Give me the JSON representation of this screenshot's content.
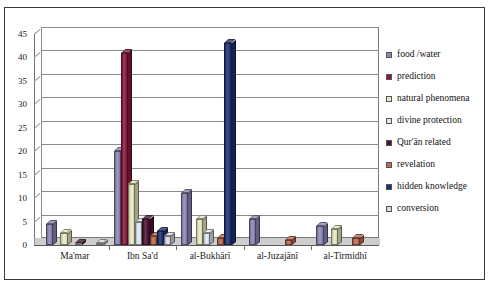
{
  "chart_data": {
    "type": "bar",
    "title": "",
    "subtitle": "",
    "xlabel": "",
    "ylabel": "",
    "ylim": [
      0,
      45
    ],
    "ytick_step": 5,
    "yticks": [
      0,
      5,
      10,
      15,
      20,
      25,
      30,
      35,
      40,
      45
    ],
    "grid": true,
    "grid_orientation": "horizontal",
    "legend_position": "right",
    "three_d": true,
    "categories": [
      "Ma'mar",
      "Ibn Sa'd",
      "al-Bukhārī",
      "al-Juzajānī",
      "al-Tirmidhī"
    ],
    "series": [
      {
        "name": "food /water",
        "color": "#8d86b5",
        "values": [
          4.5,
          20,
          11,
          5.5,
          4
        ]
      },
      {
        "name": "prediction",
        "color": "#8c1a3c",
        "values": [
          0,
          41,
          0,
          0,
          0
        ]
      },
      {
        "name": "natural phenomena",
        "color": "#e8e8c0",
        "values": [
          2.5,
          13,
          5.5,
          0,
          3.5
        ]
      },
      {
        "name": "divine protection",
        "color": "#dfe7f0",
        "values": [
          0,
          5,
          2.5,
          0,
          0
        ]
      },
      {
        "name": "Qur'ān related",
        "color": "#4c1133",
        "values": [
          0.4,
          5.5,
          0,
          0,
          0
        ]
      },
      {
        "name": "revelation",
        "color": "#c0694e",
        "values": [
          0,
          2,
          1.5,
          1,
          1.5
        ]
      },
      {
        "name": "hidden knowledge",
        "color": "#1f3173",
        "values": [
          0,
          3,
          43,
          0,
          0
        ]
      },
      {
        "name": "conversion",
        "color": "#d9d9e4",
        "values": [
          0.5,
          2,
          0,
          0,
          0
        ]
      }
    ]
  },
  "legend": {
    "items": [
      {
        "label": "food /water"
      },
      {
        "label": "prediction"
      },
      {
        "label": "natural phenomena"
      },
      {
        "label": "divine protection"
      },
      {
        "label": "Qur'ān related"
      },
      {
        "label": "revelation"
      },
      {
        "label": "hidden knowledge"
      },
      {
        "label": "conversion"
      }
    ]
  },
  "axis": {
    "y_labels": [
      "45",
      "40",
      "35",
      "30",
      "25",
      "20",
      "15",
      "10",
      "5",
      "0"
    ],
    "x_labels": [
      "Ma'mar",
      "Ibn Sa'd",
      "al-Bukhārī",
      "al-Juzajānī",
      "al-Tirmidhī"
    ]
  }
}
